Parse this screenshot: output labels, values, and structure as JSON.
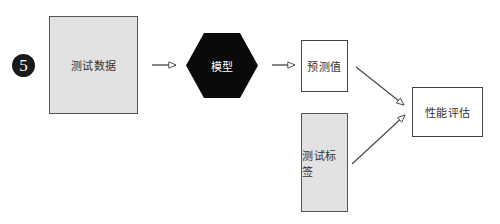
{
  "step": {
    "number": "5"
  },
  "nodes": {
    "test_data": {
      "label": "测试数据",
      "fill": "#e2e2e2"
    },
    "model": {
      "label": "模型",
      "fill": "#0a0a0a"
    },
    "prediction": {
      "label": "预测值",
      "fill": "#ffffff"
    },
    "test_label": {
      "label": "测试标签",
      "fill": "#e2e2e2"
    },
    "evaluation": {
      "label": "性能评估",
      "fill": "#ffffff"
    }
  },
  "edges": [
    {
      "from": "test_data",
      "to": "model"
    },
    {
      "from": "model",
      "to": "prediction"
    },
    {
      "from": "prediction",
      "to": "evaluation"
    },
    {
      "from": "test_label",
      "to": "evaluation"
    }
  ]
}
